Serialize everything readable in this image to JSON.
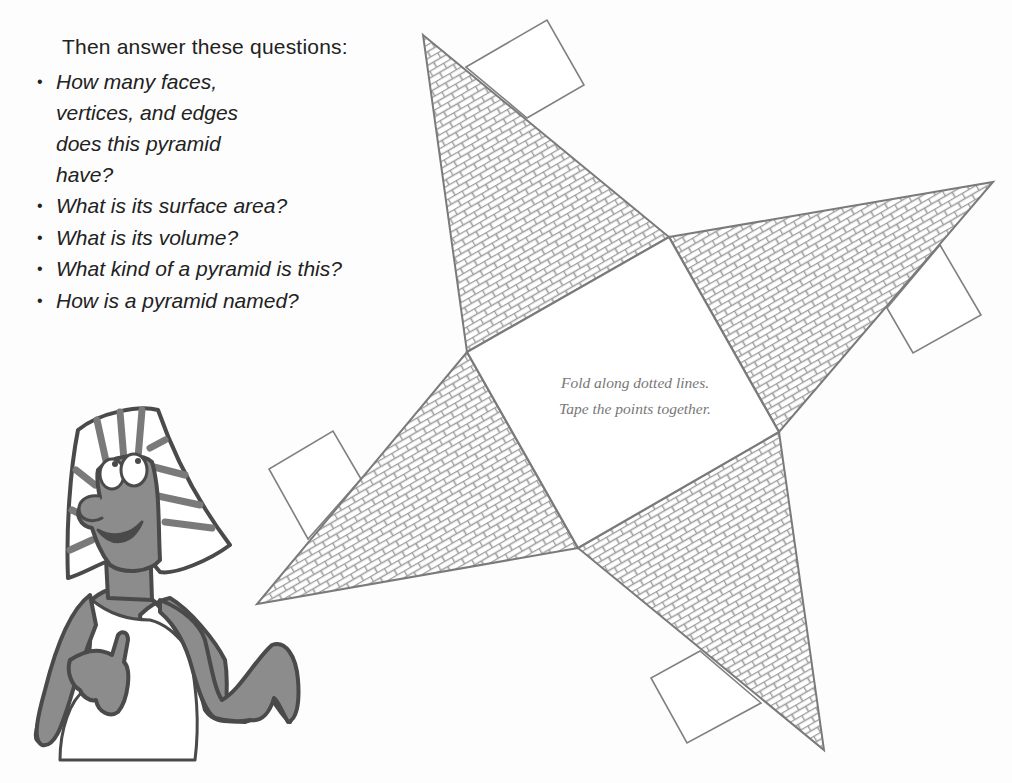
{
  "worksheet": {
    "heading": "Then answer these questions:",
    "questions": [
      {
        "bullet": "•",
        "text": "How many faces, vertices, and edges does this pyramid have?"
      },
      {
        "bullet": "•",
        "text": "What is its surface area?"
      },
      {
        "bullet": "•",
        "text": "What is its volume?"
      },
      {
        "bullet": "•",
        "text": "What kind of a pyramid is this?"
      },
      {
        "bullet": "•",
        "text": "How is a pyramid named?"
      }
    ]
  },
  "net": {
    "instructions": {
      "line1": "Fold along dotted lines.",
      "line2": "Tape the points together."
    },
    "base_shape": "square",
    "faces": 4,
    "tabs": 4,
    "face_pattern": "brick",
    "colors": {
      "outline": "#7a7a7a",
      "mortar": "#9c9c9c",
      "brick": "#ffffff",
      "text": "#777777"
    }
  },
  "illustration": {
    "subject": "cartoon pharaoh character",
    "colors": {
      "skin": "#8c8c8c",
      "outline": "#4a4a4a",
      "headdress": "#ffffff"
    }
  }
}
